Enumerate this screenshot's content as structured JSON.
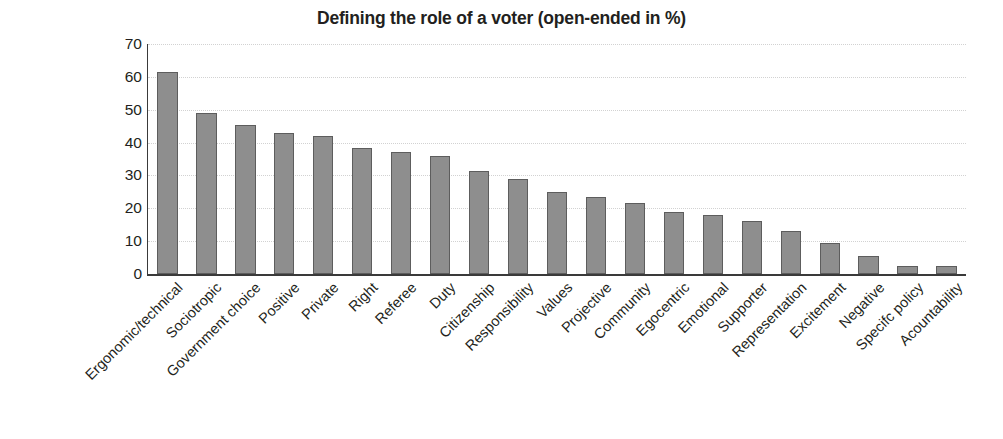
{
  "chart_data": {
    "type": "bar",
    "title": "Defining the role of a voter (open-ended in %)",
    "xlabel": "",
    "ylabel": "",
    "ylim": [
      0,
      70
    ],
    "yticks": [
      0,
      10,
      20,
      30,
      40,
      50,
      60,
      70
    ],
    "grid": true,
    "legend": null,
    "categories": [
      "Ergonomic/technical",
      "Sociotropic",
      "Government choice",
      "Positive",
      "Private",
      "Right",
      "Referee",
      "Duty",
      "Citizenship",
      "Responsibility",
      "Values",
      "Projective",
      "Community",
      "Egocentric",
      "Emotional",
      "Supporter",
      "Representation",
      "Excitement",
      "Negative",
      "Specifc policy",
      "Acountability"
    ],
    "values": [
      61.5,
      49.0,
      45.5,
      43.0,
      42.0,
      38.5,
      37.0,
      36.0,
      31.5,
      29.0,
      25.0,
      23.5,
      21.5,
      19.0,
      18.0,
      16.0,
      13.0,
      9.5,
      5.5,
      2.5,
      2.5
    ],
    "bar_color": "#8e8e8e",
    "bar_border_color": "#5d5d5d",
    "axis_color": "#3a3a3a",
    "grid_color": "#d2d2d2",
    "text_color": "#231f20"
  }
}
